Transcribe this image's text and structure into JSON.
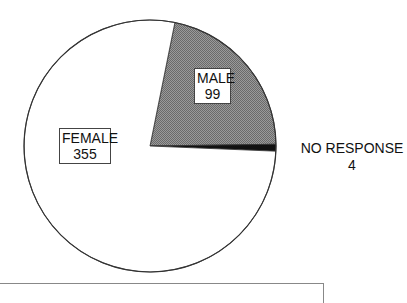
{
  "chart_data": {
    "type": "pie",
    "title": "",
    "total": 458,
    "start_angle_deg": 11.4,
    "direction": "clockwise",
    "slices": [
      {
        "name": "MALE",
        "value": 99,
        "fill": "#8a8a8a",
        "pattern": "crosshatch"
      },
      {
        "name": "NO RESPONSE",
        "value": 4,
        "fill": "#111111",
        "pattern": "solid"
      },
      {
        "name": "FEMALE",
        "value": 355,
        "fill": "#ffffff",
        "pattern": "solid"
      }
    ],
    "labels": {
      "male": {
        "name": "MALE",
        "value": "99"
      },
      "no_response": {
        "name": "NO RESPONSE",
        "value": "4"
      },
      "female": {
        "name": "FEMALE",
        "value": "355"
      }
    },
    "colors": {
      "outline": "#333333",
      "background": "#ffffff"
    }
  }
}
